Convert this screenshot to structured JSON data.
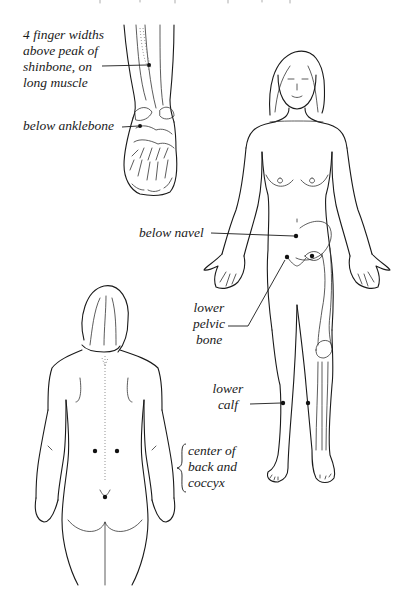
{
  "figure": {
    "background_color": "#ffffff",
    "line_color": "#1a1a1a"
  },
  "labels": {
    "shinbone": "4 finger widths\nabove peak of\nshinbone, on\nlong muscle",
    "anklebone": "below anklebone",
    "navel": "below navel",
    "pelvic": "lower\npelvic\nbone",
    "calf": "lower\ncalf",
    "back": "center of\nback and\ncoccyx"
  },
  "panels": [
    {
      "name": "leg-foot-detail",
      "points": [
        "shinbone",
        "anklebone"
      ]
    },
    {
      "name": "front-view",
      "points": [
        "navel",
        "pelvic",
        "calf"
      ]
    },
    {
      "name": "back-view",
      "points": [
        "back"
      ]
    }
  ]
}
